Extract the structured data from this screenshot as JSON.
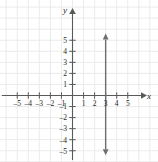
{
  "figure": {
    "kind": "coordinate-plane-graph",
    "background_color": "#ffffff",
    "grid_color": "#e9e9e9",
    "axis_color": "#58595b",
    "plot_color": "#6d6e71",
    "label_color": "#231f20"
  },
  "axes": {
    "x_axis_label": "x",
    "y_axis_label": "y",
    "x_tick_labels": [
      "-5",
      "-4",
      "-3",
      "-2",
      "-1",
      "1",
      "2",
      "3",
      "4",
      "5"
    ],
    "y_tick_labels": [
      "5",
      "4",
      "3",
      "2",
      "1",
      "-1",
      "-2",
      "-3",
      "-4",
      "-5"
    ]
  },
  "chart_data": {
    "type": "line",
    "title": "",
    "xlabel": "x",
    "ylabel": "y",
    "xlim": [
      -6.5,
      6.5
    ],
    "ylim": [
      -6,
      6.2
    ],
    "xticks": [
      -5,
      -4,
      -3,
      -2,
      -1,
      1,
      2,
      3,
      4,
      5
    ],
    "yticks": [
      5,
      4,
      3,
      2,
      1,
      -1,
      -2,
      -3,
      -4,
      -5
    ],
    "grid": true,
    "grid_spacing": 1,
    "legend": "none",
    "series": [
      {
        "name": "x = 3",
        "equation": "x = 3",
        "orientation": "vertical",
        "x_intercept": 3,
        "arrows": "both",
        "x": [
          3,
          3
        ],
        "y": [
          -5.4,
          5.6
        ]
      }
    ]
  },
  "ticks": {
    "x": [
      {
        "label": "-5",
        "value": -5
      },
      {
        "label": "-4",
        "value": -4
      },
      {
        "label": "-3",
        "value": -3
      },
      {
        "label": "-2",
        "value": -2
      },
      {
        "label": "-1",
        "value": -1
      },
      {
        "label": "1",
        "value": 1
      },
      {
        "label": "2",
        "value": 2
      },
      {
        "label": "3",
        "value": 3
      },
      {
        "label": "4",
        "value": 4
      },
      {
        "label": "5",
        "value": 5
      }
    ],
    "y": [
      {
        "label": "5",
        "value": 5
      },
      {
        "label": "4",
        "value": 4
      },
      {
        "label": "3",
        "value": 3
      },
      {
        "label": "2",
        "value": 2
      },
      {
        "label": "1",
        "value": 1
      },
      {
        "label": "-1",
        "value": -1
      },
      {
        "label": "-2",
        "value": -2
      },
      {
        "label": "-3",
        "value": -3
      },
      {
        "label": "-4",
        "value": -4
      },
      {
        "label": "-5",
        "value": -5
      }
    ]
  }
}
